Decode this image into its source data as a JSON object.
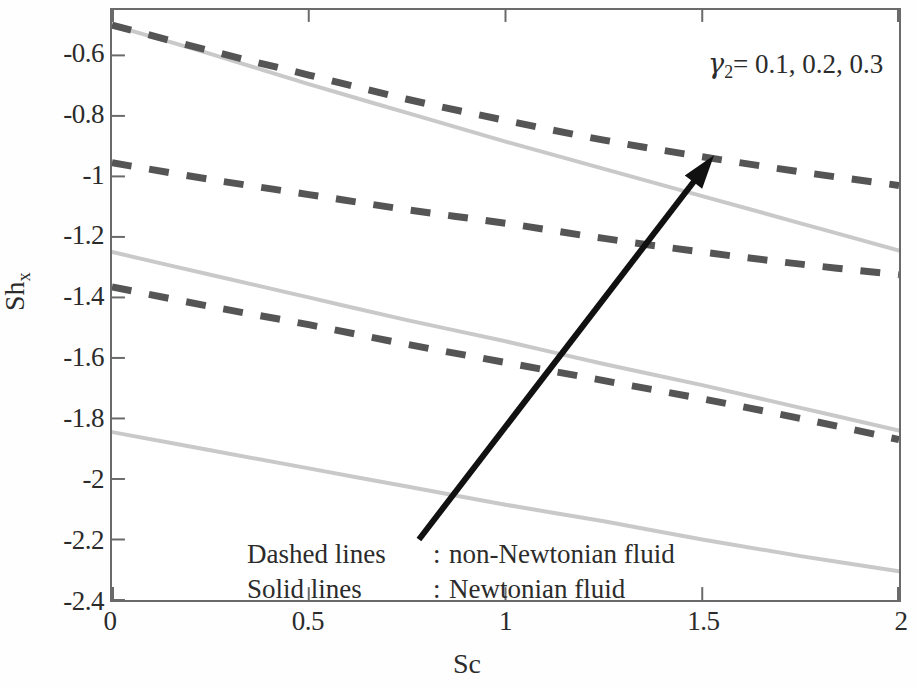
{
  "figure": {
    "y_axis_title": "Sh",
    "y_axis_title_sub": "x",
    "x_axis_title": "Sc"
  },
  "annotations": {
    "gamma_symbol": "γ",
    "gamma_subscript": "2",
    "gamma_values": "= 0.1, 0.2, 0.3",
    "arrow_name": "increasing-gamma2-arrow"
  },
  "legend": {
    "rows": [
      {
        "key": "Dashed lines",
        "colon": ":",
        "value": "non-Newtonian fluid"
      },
      {
        "key": "Solid lines",
        "colon": ":",
        "value": "Newtonian fluid"
      }
    ]
  },
  "chart_data": {
    "type": "line",
    "title": "",
    "subtitle": "",
    "xlabel": "Sc",
    "ylabel": "Sh_x",
    "xlim": [
      0,
      2
    ],
    "ylim": [
      -2.4,
      -0.45
    ],
    "xticks": [
      0,
      0.5,
      1,
      1.5,
      2
    ],
    "xtick_labels": [
      "0",
      "0.5",
      "1",
      "1.5",
      "2"
    ],
    "yticks": [
      -0.6,
      -0.8,
      -1,
      -1.2,
      -1.4,
      -1.6,
      -1.8,
      -2,
      -2.2,
      -2.4
    ],
    "ytick_labels": [
      "-0.6",
      "-0.8",
      "-1",
      "-1.2",
      "-1.4",
      "-1.6",
      "-1.8",
      "-2",
      "-2.2",
      "-2.4"
    ],
    "grid": false,
    "legend_position": "in-plot-bottom-left",
    "annotation_text": "γ₂ = 0.1, 0.2, 0.3",
    "colors": {
      "dashed": "#555555",
      "solid": "#c9c9c9",
      "arrow": "#111111",
      "frame": "#6a6a6a",
      "text": "#2b2b2b"
    },
    "x": [
      0,
      0.25,
      0.5,
      0.75,
      1,
      1.25,
      1.5,
      1.75,
      2
    ],
    "series": [
      {
        "name": "non-Newtonian fluid, γ₂ = 0.3",
        "style": "dashed",
        "color": "#555555",
        "values": [
          -0.5,
          -0.585,
          -0.665,
          -0.745,
          -0.815,
          -0.88,
          -0.935,
          -0.985,
          -1.03
        ]
      },
      {
        "name": "non-Newtonian fluid, γ₂ = 0.2",
        "style": "dashed",
        "color": "#555555",
        "values": [
          -0.955,
          -1.01,
          -1.06,
          -1.11,
          -1.155,
          -1.205,
          -1.25,
          -1.29,
          -1.325
        ]
      },
      {
        "name": "non-Newtonian fluid, γ₂ = 0.1",
        "style": "dashed",
        "color": "#555555",
        "values": [
          -1.365,
          -1.43,
          -1.49,
          -1.555,
          -1.615,
          -1.675,
          -1.735,
          -1.8,
          -1.87
        ]
      },
      {
        "name": "Newtonian fluid, γ₂ = 0.3",
        "style": "solid",
        "color": "#c9c9c9",
        "values": [
          -0.5,
          -0.595,
          -0.695,
          -0.79,
          -0.885,
          -0.975,
          -1.065,
          -1.155,
          -1.245
        ]
      },
      {
        "name": "Newtonian fluid, γ₂ = 0.2",
        "style": "solid",
        "color": "#c9c9c9",
        "values": [
          -1.25,
          -1.325,
          -1.4,
          -1.475,
          -1.545,
          -1.62,
          -1.69,
          -1.765,
          -1.84
        ]
      },
      {
        "name": "Newtonian fluid, γ₂ = 0.1",
        "style": "solid",
        "color": "#c9c9c9",
        "values": [
          -1.845,
          -1.905,
          -1.965,
          -2.025,
          -2.085,
          -2.14,
          -2.2,
          -2.255,
          -2.305
        ]
      }
    ],
    "arrow": {
      "from": [
        0.78,
        -2.2
      ],
      "to": [
        1.53,
        -0.93
      ]
    }
  }
}
